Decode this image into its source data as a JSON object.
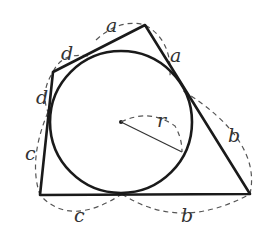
{
  "figure": {
    "labels": {
      "a_top": "a",
      "a_right": "a",
      "d_top": "d",
      "d_left": "d",
      "c_left": "c",
      "c_bottom": "c",
      "b_right": "b",
      "b_bottom": "b",
      "radius": "r"
    },
    "colors": {
      "stroke": "#1a1a1a",
      "dashed": "#555555",
      "background": "#ffffff"
    }
  }
}
